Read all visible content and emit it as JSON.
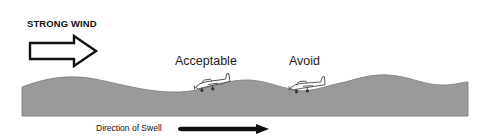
{
  "diagram": {
    "wind": {
      "label": "STRONG WIND",
      "icon": "hollow-right-arrow"
    },
    "positions": [
      {
        "label": "Acceptable",
        "icon": "airplane-icon",
        "location": "crest of swell"
      },
      {
        "label": "Avoid",
        "icon": "airplane-icon",
        "location": "trough / face of swell"
      }
    ],
    "swell": {
      "label": "Direction of Swell",
      "icon": "solid-right-arrow"
    },
    "colors": {
      "sea_fill": "#9a9a9a",
      "sea_edge": "#6e6e6e",
      "outline": "#111111",
      "background": "#ffffff"
    }
  }
}
